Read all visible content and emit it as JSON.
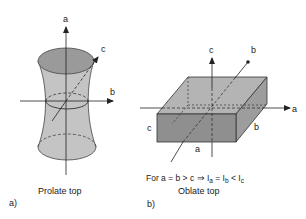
{
  "panel_a": {
    "tag": "a)",
    "caption": "Prolate top",
    "axes": {
      "vertical": "a",
      "horizontal": "b",
      "diagonal": "c"
    }
  },
  "panel_b": {
    "tag": "b)",
    "formula": {
      "prefix": "For a = b > c ⇒ I",
      "sub_a": "a",
      "mid1": " = I",
      "sub_b": "b",
      "mid2": " < I",
      "sub_c": "c"
    },
    "caption": "Oblate top",
    "axes": {
      "vertical": "c",
      "horizontal": "a",
      "diagonal": "b"
    },
    "edge_labels": {
      "height": "c",
      "width": "a",
      "depth": "b"
    }
  },
  "colors": {
    "top_face": "#b4b4b4",
    "front_face": "#8f8f8f",
    "side_face": "#9d9d9d",
    "body_fill": "#c4c4c4",
    "ellipse_top": "#9a9a9a",
    "line": "#333333"
  }
}
